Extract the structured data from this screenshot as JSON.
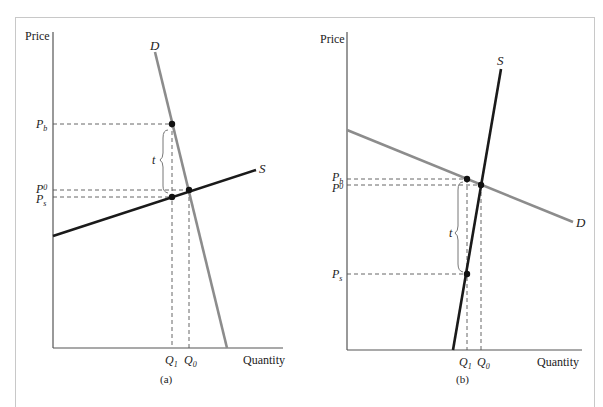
{
  "figure": {
    "panels": [
      {
        "id": "a",
        "caption": "(a)",
        "y_axis_label": "Price",
        "x_axis_label": "Quantity",
        "demand_label": "D",
        "supply_label": "S",
        "tax_label": "t",
        "price_labels": {
          "buyer": "P",
          "buyer_sub": "b",
          "equilibrium": "P",
          "equilibrium_sub": "0",
          "seller": "P",
          "seller_sub": "s"
        },
        "quantity_labels": {
          "q1": "Q",
          "q1_sub": "1",
          "q0": "Q",
          "q0_sub": "0"
        },
        "description": "Inelastic (steep) demand, elastic (flat) supply: tax burden falls mostly on buyers"
      },
      {
        "id": "b",
        "caption": "(b)",
        "y_axis_label": "Price",
        "x_axis_label": "Quantity",
        "demand_label": "D",
        "supply_label": "S",
        "tax_label": "t",
        "price_labels": {
          "buyer": "P",
          "buyer_sub": "b",
          "equilibrium": "P",
          "equilibrium_sub": "0",
          "seller": "P",
          "seller_sub": "s"
        },
        "quantity_labels": {
          "q1": "Q",
          "q1_sub": "1",
          "q0": "Q",
          "q0_sub": "0"
        },
        "description": "Elastic (flat) demand, inelastic (steep) supply: tax burden falls mostly on sellers"
      }
    ],
    "colors": {
      "demand": "#8c8c8c",
      "supply": "#1a1a1a",
      "axis": "#555555",
      "dashed": "#555555",
      "frame": "#c8c8c8"
    }
  }
}
